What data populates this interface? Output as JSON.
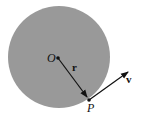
{
  "diagram": {
    "circle": {
      "cx": 59,
      "cy": 57,
      "r": 51,
      "fill": "#999999"
    },
    "center_label": "O",
    "point_label": "P",
    "radius_vector_label": "r",
    "velocity_vector_label": "v",
    "colors": {
      "circle_fill": "#999999",
      "stroke": "#111111",
      "background": "#ffffff"
    }
  }
}
